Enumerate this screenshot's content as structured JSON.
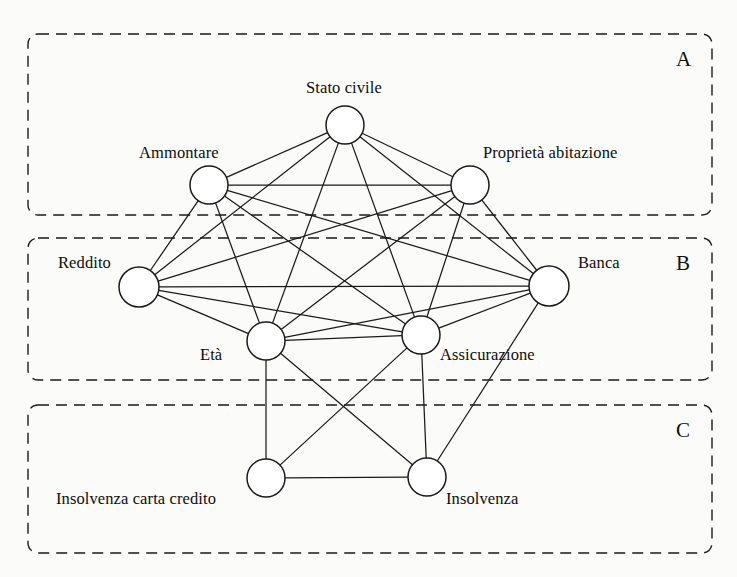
{
  "figure": {
    "background_color": "#fbfbf9",
    "stroke_color": "#1a1a1a",
    "node_fill": "#ffffff"
  },
  "tiers": [
    {
      "id": "A",
      "label": "A",
      "label_x": 676,
      "label_y": 47,
      "x": 28,
      "y": 34,
      "w": 684,
      "h": 181
    },
    {
      "id": "B",
      "label": "B",
      "label_x": 676,
      "label_y": 251,
      "x": 28,
      "y": 238,
      "w": 684,
      "h": 142
    },
    {
      "id": "C",
      "label": "C",
      "label_x": 676,
      "label_y": 418,
      "x": 28,
      "y": 405,
      "w": 684,
      "h": 148
    }
  ],
  "nodes": [
    {
      "id": "stato_civile",
      "label": "Stato civile",
      "tier": "A",
      "cx": 345,
      "cy": 125,
      "r": 19,
      "label_x": 306,
      "label_y": 78,
      "label_align": "left"
    },
    {
      "id": "ammontare",
      "label": "Ammontare",
      "tier": "A",
      "cx": 209,
      "cy": 185,
      "r": 19,
      "label_x": 139,
      "label_y": 143,
      "label_align": "left"
    },
    {
      "id": "proprieta",
      "label": "Proprietà abitazione",
      "tier": "A",
      "cx": 470,
      "cy": 185,
      "r": 19,
      "label_x": 483,
      "label_y": 143,
      "label_align": "left"
    },
    {
      "id": "reddito",
      "label": "Reddito",
      "tier": "B",
      "cx": 139,
      "cy": 287,
      "r": 20,
      "label_x": 58,
      "label_y": 253,
      "label_align": "left"
    },
    {
      "id": "banca",
      "label": "Banca",
      "tier": "B",
      "cx": 549,
      "cy": 286,
      "r": 20,
      "label_x": 578,
      "label_y": 253,
      "label_align": "left"
    },
    {
      "id": "eta",
      "label": "Età",
      "tier": "B",
      "cx": 266,
      "cy": 341,
      "r": 19,
      "label_x": 200,
      "label_y": 345,
      "label_align": "left"
    },
    {
      "id": "assicurazione",
      "label": "Assicurazione",
      "tier": "B",
      "cx": 421,
      "cy": 335,
      "r": 19,
      "label_x": 440,
      "label_y": 345,
      "label_align": "left"
    },
    {
      "id": "insolvenza_cc",
      "label": "Insolvenza carta credito",
      "tier": "C",
      "cx": 266,
      "cy": 478,
      "r": 19,
      "label_x": 56,
      "label_y": 489,
      "label_align": "left"
    },
    {
      "id": "insolvenza",
      "label": "Insolvenza",
      "tier": "C",
      "cx": 427,
      "cy": 477,
      "r": 19,
      "label_x": 446,
      "label_y": 489,
      "label_align": "left"
    }
  ],
  "edges": [
    {
      "from": "stato_civile",
      "to": "ammontare"
    },
    {
      "from": "stato_civile",
      "to": "proprieta"
    },
    {
      "from": "stato_civile",
      "to": "reddito"
    },
    {
      "from": "stato_civile",
      "to": "banca"
    },
    {
      "from": "stato_civile",
      "to": "eta"
    },
    {
      "from": "stato_civile",
      "to": "assicurazione"
    },
    {
      "from": "ammontare",
      "to": "proprieta"
    },
    {
      "from": "ammontare",
      "to": "reddito"
    },
    {
      "from": "ammontare",
      "to": "banca"
    },
    {
      "from": "ammontare",
      "to": "eta"
    },
    {
      "from": "ammontare",
      "to": "assicurazione"
    },
    {
      "from": "proprieta",
      "to": "reddito"
    },
    {
      "from": "proprieta",
      "to": "banca"
    },
    {
      "from": "proprieta",
      "to": "eta"
    },
    {
      "from": "proprieta",
      "to": "assicurazione"
    },
    {
      "from": "reddito",
      "to": "banca"
    },
    {
      "from": "reddito",
      "to": "eta"
    },
    {
      "from": "reddito",
      "to": "assicurazione"
    },
    {
      "from": "eta",
      "to": "assicurazione"
    },
    {
      "from": "eta",
      "to": "banca"
    },
    {
      "from": "assicurazione",
      "to": "banca"
    },
    {
      "from": "eta",
      "to": "insolvenza_cc"
    },
    {
      "from": "eta",
      "to": "insolvenza"
    },
    {
      "from": "assicurazione",
      "to": "insolvenza_cc"
    },
    {
      "from": "assicurazione",
      "to": "insolvenza"
    },
    {
      "from": "banca",
      "to": "insolvenza"
    },
    {
      "from": "insolvenza_cc",
      "to": "insolvenza"
    }
  ]
}
